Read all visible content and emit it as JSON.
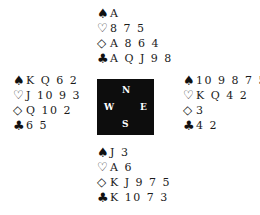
{
  "suit_icons": {
    "spades": "♠",
    "hearts": "♡",
    "diamonds": "◇",
    "clubs": "♣"
  },
  "compass": {
    "north": "N",
    "west": "W",
    "east": "E",
    "south": "S"
  },
  "hands": {
    "north": {
      "spades": "A",
      "hearts": "8 7 5",
      "diamonds": "A 8 6 4",
      "clubs": "A Q J 9 8"
    },
    "west": {
      "spades": "K Q 6 2",
      "hearts": "J 10 9 3",
      "diamonds": "Q 10 2",
      "clubs": "6 5"
    },
    "east": {
      "spades": "10 9 8 7 5 4",
      "hearts": "K Q 4 2",
      "diamonds": "3",
      "clubs": "4 2"
    },
    "south": {
      "spades": "J 3",
      "hearts": "A 6",
      "diamonds": "K J 9 7 5",
      "clubs": "K 10 7 3"
    }
  }
}
